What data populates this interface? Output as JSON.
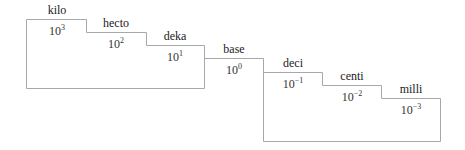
{
  "diagram": {
    "prefixes": [
      {
        "name": "kilo",
        "base": "10",
        "exponent": "3"
      },
      {
        "name": "hecto",
        "base": "10",
        "exponent": "2"
      },
      {
        "name": "deka",
        "base": "10",
        "exponent": "1"
      },
      {
        "name": "base",
        "base": "10",
        "exponent": "0"
      },
      {
        "name": "deci",
        "base": "10",
        "exponent": "−1"
      },
      {
        "name": "centi",
        "base": "10",
        "exponent": "−2"
      },
      {
        "name": "milli",
        "base": "10",
        "exponent": "−3"
      }
    ],
    "line_color": "#a8a8a8"
  }
}
